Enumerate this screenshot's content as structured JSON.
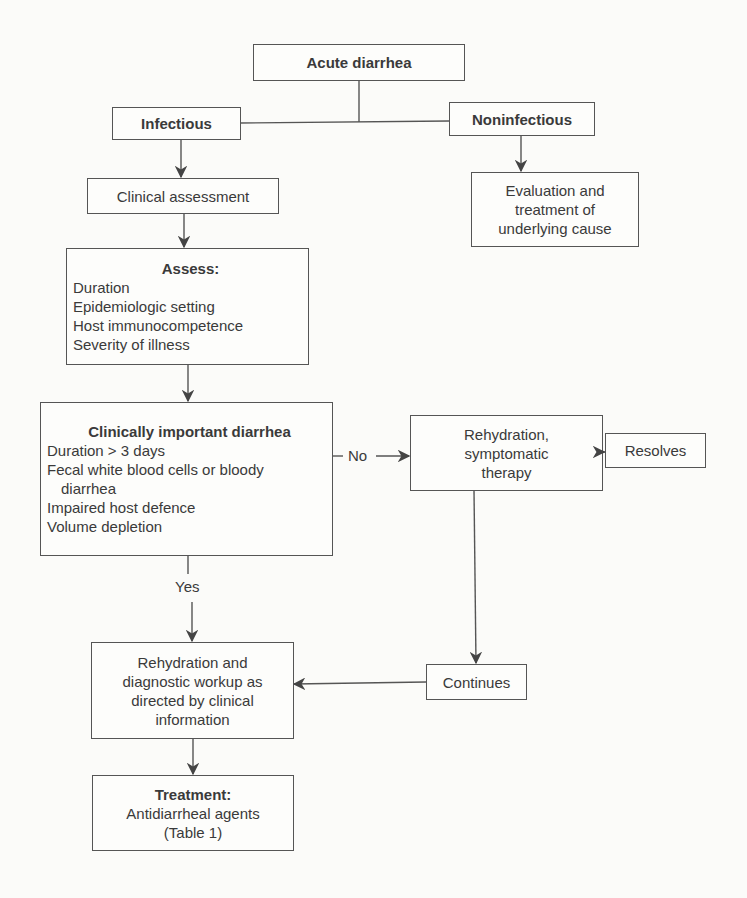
{
  "diagram": {
    "type": "flowchart",
    "title": "Acute diarrhea",
    "nodes": {
      "acute": {
        "label": "Acute diarrhea"
      },
      "infectious": {
        "label": "Infectious"
      },
      "noninfectious": {
        "label": "Noninfectious"
      },
      "evaluation": {
        "lines": [
          "Evaluation and",
          "treatment of",
          "underlying cause"
        ]
      },
      "clinical_assessment": {
        "label": "Clinical assessment"
      },
      "assess": {
        "title": "Assess:",
        "items": [
          "Duration",
          "Epidemiologic setting",
          "Host immunocompetence",
          "Severity of illness"
        ]
      },
      "clinically_important": {
        "title": "Clinically important diarrhea",
        "items": [
          "Duration > 3 days",
          "Fecal white blood cells or bloody",
          "diarrhea",
          "Impaired host defence",
          "Volume depletion"
        ]
      },
      "rehydration_symptomatic": {
        "lines": [
          "Rehydration,",
          "symptomatic",
          "therapy"
        ]
      },
      "resolves": {
        "label": "Resolves"
      },
      "continues": {
        "label": "Continues"
      },
      "rehydration_diagnostic": {
        "lines": [
          "Rehydration and",
          "diagnostic workup as",
          "directed by clinical",
          "information"
        ]
      },
      "treatment": {
        "title": "Treatment:",
        "lines": [
          "Antidiarrheal agents",
          "(Table 1)"
        ]
      }
    },
    "edges": [
      {
        "from": "acute",
        "to": "infectious",
        "label": ""
      },
      {
        "from": "acute",
        "to": "noninfectious",
        "label": ""
      },
      {
        "from": "noninfectious",
        "to": "evaluation",
        "label": ""
      },
      {
        "from": "infectious",
        "to": "clinical_assessment",
        "label": ""
      },
      {
        "from": "clinical_assessment",
        "to": "assess",
        "label": ""
      },
      {
        "from": "assess",
        "to": "clinically_important",
        "label": ""
      },
      {
        "from": "clinically_important",
        "to": "rehydration_symptomatic",
        "label": "No"
      },
      {
        "from": "clinically_important",
        "to": "rehydration_diagnostic",
        "label": "Yes"
      },
      {
        "from": "rehydration_symptomatic",
        "to": "resolves",
        "label": ""
      },
      {
        "from": "rehydration_symptomatic",
        "to": "continues",
        "label": ""
      },
      {
        "from": "continues",
        "to": "rehydration_diagnostic",
        "label": ""
      },
      {
        "from": "rehydration_diagnostic",
        "to": "treatment",
        "label": ""
      }
    ],
    "edge_labels": {
      "no": "No",
      "yes": "Yes"
    },
    "colors": {
      "line": "#555555",
      "text": "#3a3a3a",
      "background": "#fbfbf9"
    }
  }
}
